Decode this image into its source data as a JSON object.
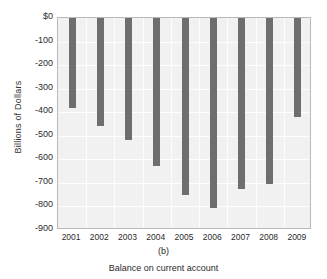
{
  "chart_data": {
    "type": "bar",
    "title": "",
    "panel_letter": "(b)",
    "xlabel": "Balance on current account",
    "ylabel": "Billions of Dollars",
    "categories": [
      "2001",
      "2002",
      "2003",
      "2004",
      "2005",
      "2006",
      "2007",
      "2008",
      "2009"
    ],
    "values": [
      -380,
      -460,
      -520,
      -630,
      -750,
      -805,
      -727,
      -706,
      -420
    ],
    "ylim": [
      -900,
      0
    ],
    "ytick_values": [
      0,
      -100,
      -200,
      -300,
      -400,
      -500,
      -600,
      -700,
      -800,
      -900
    ],
    "ytick_labels": [
      "$0",
      "-100",
      "-200",
      "-300",
      "-400",
      "-500",
      "-600",
      "-700",
      "-800",
      "-900"
    ],
    "grid": true,
    "legend": "none",
    "bar_color": "#6e6e6e",
    "plot_background": "#f1f1f1",
    "gridline_color": "#ffffff"
  }
}
